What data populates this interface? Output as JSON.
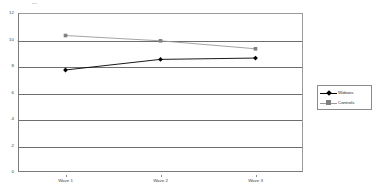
{
  "chart_data": {
    "type": "line",
    "title": "",
    "subtitle": "",
    "xlabel": "",
    "ylabel": "",
    "categories": [
      "Wave 1",
      "Wave 2",
      "Wave 3"
    ],
    "series": [
      {
        "name": "Widows",
        "values": [
          7.7,
          8.5,
          8.6
        ],
        "color": "#000000",
        "marker": "diamond"
      },
      {
        "name": "Controls",
        "values": [
          10.3,
          9.9,
          9.3
        ],
        "color": "#808080",
        "marker": "square"
      }
    ],
    "ylim": [
      0,
      12
    ],
    "yticks": [
      0,
      2,
      4,
      6,
      8,
      10,
      12
    ],
    "ytick_labels": [
      "0",
      "2",
      "4",
      "6",
      "8",
      "10",
      "12"
    ],
    "grid": true,
    "grid_axis": "y",
    "legend_position": "right",
    "legend_entries": [
      "Widows",
      "Controls"
    ]
  },
  "legend": {
    "items": [
      {
        "label": "Widows",
        "marker": "diamond-marker-icon"
      },
      {
        "label": "Controls",
        "marker": "square-marker-icon"
      }
    ]
  },
  "axes": {
    "y_axis_name": "value-axis",
    "x_axis_name": "wave-axis"
  }
}
